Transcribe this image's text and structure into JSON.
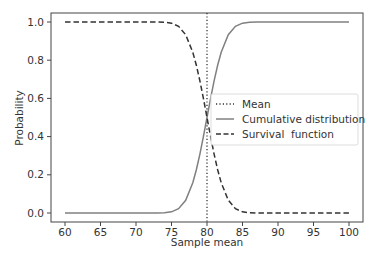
{
  "chart_data": {
    "type": "line",
    "title": "",
    "xlabel": "Sample mean",
    "ylabel": "Probability",
    "xlim": [
      58,
      102
    ],
    "ylim": [
      -0.05,
      1.05
    ],
    "xticks": [
      60,
      65,
      70,
      75,
      80,
      85,
      90,
      95,
      100
    ],
    "yticks": [
      0.0,
      0.2,
      0.4,
      0.6,
      0.8,
      1.0
    ],
    "xtick_labels": [
      "60",
      "65",
      "70",
      "75",
      "80",
      "85",
      "90",
      "95",
      "100"
    ],
    "ytick_labels": [
      "0.0",
      "0.2",
      "0.4",
      "0.6",
      "0.8",
      "1.0"
    ],
    "grid": false,
    "legend_position": "center right",
    "x": [
      60,
      62,
      64,
      66,
      68,
      70,
      72,
      73,
      74,
      75,
      76,
      77,
      78,
      78.5,
      79,
      79.5,
      80,
      80.5,
      81,
      81.5,
      82,
      83,
      84,
      85,
      86,
      87,
      88,
      90,
      92,
      94,
      96,
      98,
      100
    ],
    "series": [
      {
        "name": "Mean",
        "style": "dotted",
        "color": "#333333",
        "vline_x": 80
      },
      {
        "name": "Cumulative distribution",
        "style": "solid",
        "color": "#808080",
        "values": [
          0.0,
          0.0,
          0.0,
          0.0,
          0.0,
          0.0,
          0.0,
          0.0002,
          0.0013,
          0.0062,
          0.0228,
          0.0668,
          0.1587,
          0.2266,
          0.3085,
          0.4013,
          0.5,
          0.5987,
          0.6915,
          0.7734,
          0.8413,
          0.9332,
          0.9772,
          0.9938,
          0.9987,
          0.9998,
          1.0,
          1.0,
          1.0,
          1.0,
          1.0,
          1.0,
          1.0
        ]
      },
      {
        "name": "Survival function",
        "style": "dashed",
        "color": "#333333",
        "values": [
          1.0,
          1.0,
          1.0,
          1.0,
          1.0,
          1.0,
          1.0,
          0.9998,
          0.9987,
          0.9938,
          0.9772,
          0.9332,
          0.8413,
          0.7734,
          0.6915,
          0.5987,
          0.5,
          0.4013,
          0.3085,
          0.2266,
          0.1587,
          0.0668,
          0.0228,
          0.0062,
          0.0013,
          0.0002,
          0.0,
          0.0,
          0.0,
          0.0,
          0.0,
          0.0,
          0.0
        ]
      }
    ]
  },
  "legend": {
    "items": [
      {
        "label": "Mean"
      },
      {
        "label": "Cumulative distribution"
      },
      {
        "label": "Survival  function"
      }
    ]
  }
}
